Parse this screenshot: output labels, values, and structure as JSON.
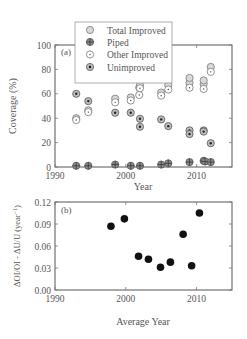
{
  "chart_data": [
    {
      "type": "scatter",
      "panel_label": "(a)",
      "title": "",
      "xlabel": "Year",
      "ylabel": "Coverage (%)",
      "xlim": [
        1990,
        2015
      ],
      "ylim": [
        0,
        100
      ],
      "xticks": [
        1990,
        2000,
        2010
      ],
      "yticks": [
        0,
        20,
        40,
        60,
        80,
        100
      ],
      "grid": false,
      "legend_position": "upper center (overlapping top border)",
      "legend": [
        "Total Improved",
        "Piped",
        "Other Improved",
        "Unimproved"
      ],
      "series": [
        {
          "name": "Total Improved",
          "marker": "open-circle-gray",
          "points": [
            [
              1993,
              40
            ],
            [
              1994.7,
              46.5
            ],
            [
              1998.5,
              56
            ],
            [
              2000.7,
              57
            ],
            [
              2001.9,
              65
            ],
            [
              2002,
              67
            ],
            [
              2005,
              61
            ],
            [
              2006,
              67
            ],
            [
              2009,
              69
            ],
            [
              2009,
              73
            ],
            [
              2011,
              68
            ],
            [
              2011,
              71
            ],
            [
              2012,
              82
            ]
          ]
        },
        {
          "name": "Piped",
          "marker": "crossed-circle-dark",
          "points": [
            [
              1993,
              1
            ],
            [
              1994.7,
              1
            ],
            [
              1998.5,
              2
            ],
            [
              2000.7,
              1
            ],
            [
              2002,
              1
            ],
            [
              2005,
              2
            ],
            [
              2006,
              3
            ],
            [
              2009,
              4
            ],
            [
              2011,
              5
            ],
            [
              2011.2,
              4.5
            ],
            [
              2012,
              4
            ]
          ]
        },
        {
          "name": "Other Improved",
          "marker": "dot-circle-white",
          "points": [
            [
              1993,
              38.5
            ],
            [
              1994.7,
              45
            ],
            [
              1998.5,
              53
            ],
            [
              2000.7,
              54.5
            ],
            [
              2001.9,
              59
            ],
            [
              2002,
              64.5
            ],
            [
              2005,
              58.5
            ],
            [
              2006,
              63.5
            ],
            [
              2009,
              65
            ],
            [
              2011,
              64
            ],
            [
              2012,
              78
            ]
          ]
        },
        {
          "name": "Unimproved",
          "marker": "dot-circle-gray",
          "points": [
            [
              1993,
              60
            ],
            [
              1994.7,
              54
            ],
            [
              1998.5,
              44.5
            ],
            [
              2000.7,
              44.5
            ],
            [
              2002,
              39.5
            ],
            [
              2002,
              33
            ],
            [
              2005,
              39
            ],
            [
              2006,
              33.5
            ],
            [
              2009,
              30
            ],
            [
              2009,
              27
            ],
            [
              2011,
              30
            ],
            [
              2011,
              29
            ],
            [
              2012,
              19.5
            ]
          ]
        }
      ]
    },
    {
      "type": "scatter",
      "panel_label": "(b)",
      "title": "",
      "xlabel": "Average Year",
      "ylabel": "ΔOI/OI - ΔU/U (year⁻¹)",
      "xlim": [
        1990,
        2015
      ],
      "ylim": [
        0,
        0.12
      ],
      "xticks": [
        1990,
        2000,
        2010
      ],
      "yticks": [
        0.0,
        0.03,
        0.06,
        0.09,
        0.12
      ],
      "grid": false,
      "series": [
        {
          "name": "Relative change",
          "marker": "filled-circle-black",
          "points": [
            [
              1997.9,
              0.087
            ],
            [
              1999.8,
              0.097
            ],
            [
              2001.8,
              0.046
            ],
            [
              2003.2,
              0.042
            ],
            [
              2004.9,
              0.031
            ],
            [
              2006.3,
              0.038
            ],
            [
              2008.1,
              0.076
            ],
            [
              2009.3,
              0.033
            ],
            [
              2010.4,
              0.105
            ]
          ]
        }
      ]
    }
  ],
  "panel_a": {
    "label": "(a)",
    "xlabel": "Year",
    "ylabel": "Coverage (%)",
    "ytick_labels": [
      "0",
      "20",
      "40",
      "60",
      "80",
      "100"
    ],
    "xtick_labels": [
      "1990",
      "2000",
      "2010"
    ],
    "legend": {
      "total_improved": "Total Improved",
      "piped": "Piped",
      "other_improved": "Other Improved",
      "unimproved": "Unimproved"
    }
  },
  "panel_b": {
    "label": "(b)",
    "xlabel": "Average Year",
    "ylabel": "ΔOI/OI - ΔU/U (year",
    "ylabel_sup": "−1",
    "ylabel_close": ")",
    "ytick_labels": [
      "0.00",
      "0.03",
      "0.06",
      "0.09",
      "0.12"
    ],
    "xtick_labels": [
      "1990",
      "2000",
      "2010"
    ]
  },
  "colors": {
    "axis": "#555555",
    "total_improved_fill": "#d9d9d9",
    "marker_outline": "#666666",
    "piped_fill": "#8c8c8c",
    "other_improved_fill": "#ffffff",
    "unimproved_fill": "#bdbdbd",
    "dot": "#222222",
    "filled_marker": "#111111"
  }
}
